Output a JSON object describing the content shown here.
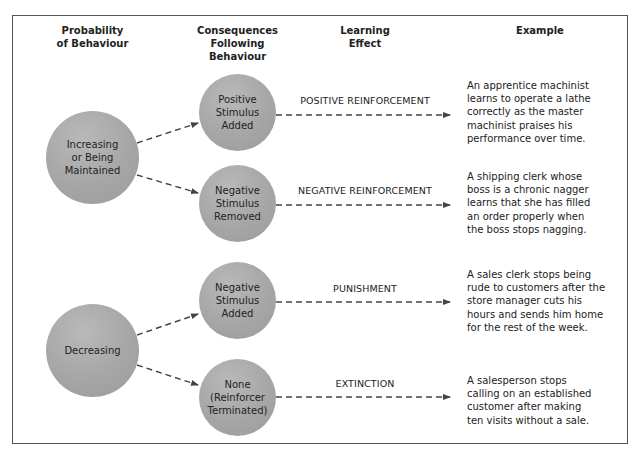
{
  "headers": {
    "probability": "Probability\nof Behaviour",
    "consequences": "Consequences\nFollowing\nBehaviour",
    "learning": "Learning\nEffect",
    "example": "Example"
  },
  "probability_nodes": [
    {
      "label": "Increasing\nor Being\nMaintained"
    },
    {
      "label": "Decreasing"
    }
  ],
  "consequence_nodes": [
    {
      "label": "Positive\nStimulus\nAdded"
    },
    {
      "label": "Negative\nStimulus\nRemoved"
    },
    {
      "label": "Negative\nStimulus\nAdded"
    },
    {
      "label": "None\n(Reinforcer\nTerminated)"
    }
  ],
  "effects": [
    {
      "label": "POSITIVE REINFORCEMENT"
    },
    {
      "label": "NEGATIVE REINFORCEMENT"
    },
    {
      "label": "PUNISHMENT"
    },
    {
      "label": "EXTINCTION"
    }
  ],
  "examples": [
    {
      "text": "An apprentice machinist\nlearns to operate a lathe\ncorrectly as the master\nmachinist praises his\nperformance over time."
    },
    {
      "text": "A shipping clerk whose\nboss is a chronic nagger\nlearns that she has filled\nan order properly when\nthe boss stops nagging."
    },
    {
      "text": "A sales clerk stops being\nrude to customers after the\nstore manager cuts his\nhours and sends him home\nfor the rest of the week."
    },
    {
      "text": "A salesperson stops\ncalling on an established\ncustomer after making\nten visits without a sale."
    }
  ],
  "colors": {
    "circle": "#a6a6a6",
    "line": "#444444",
    "border": "#555555"
  }
}
